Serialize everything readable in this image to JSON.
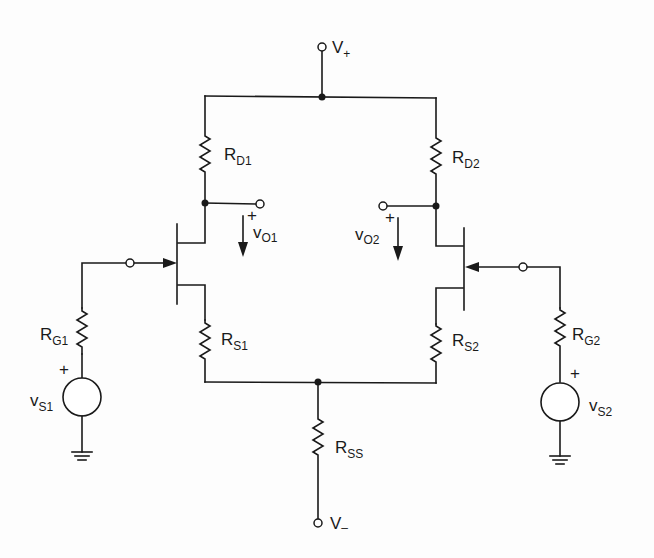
{
  "diagram": {
    "type": "circuit-schematic",
    "supplies": {
      "positive": {
        "main": "V",
        "sub": "+"
      },
      "negative": {
        "main": "V",
        "sub": "–"
      }
    },
    "resistors": {
      "rd1": {
        "main": "R",
        "sub": "D1"
      },
      "rd2": {
        "main": "R",
        "sub": "D2"
      },
      "rs1": {
        "main": "R",
        "sub": "S1"
      },
      "rs2": {
        "main": "R",
        "sub": "S2"
      },
      "rg1": {
        "main": "R",
        "sub": "G1"
      },
      "rg2": {
        "main": "R",
        "sub": "G2"
      },
      "rss": {
        "main": "R",
        "sub": "SS"
      }
    },
    "sources": {
      "vs1": {
        "main": "v",
        "sub": "S1",
        "polarity": "+"
      },
      "vs2": {
        "main": "v",
        "sub": "S2",
        "polarity": "+"
      }
    },
    "outputs": {
      "vo1": {
        "main": "v",
        "sub": "O1",
        "polarity": "+"
      },
      "vo2": {
        "main": "v",
        "sub": "O2",
        "polarity": "+"
      }
    },
    "transistors": [
      "JFET-1 (n-channel)",
      "JFET-2 (n-channel)"
    ]
  }
}
